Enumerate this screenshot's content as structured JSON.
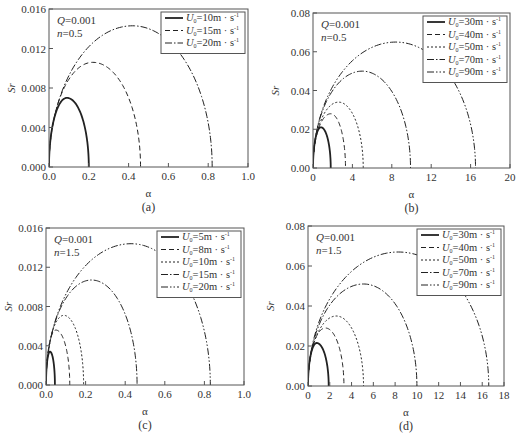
{
  "figure": {
    "panels_layout": "2x2",
    "styles": {
      "axis_color": "#555555",
      "curve_color": "#222222",
      "legend_border": "#555555"
    }
  },
  "chart_data": [
    {
      "id": "a",
      "type": "line",
      "caption": "(a)",
      "xlabel": "α",
      "ylabel": "Sr",
      "annotation": [
        "Q=0.001",
        "n=0.5"
      ],
      "annotation_parts": [
        {
          "var": "Q",
          "val": "=0.001"
        },
        {
          "var": "n",
          "val": "=0.5"
        }
      ],
      "xlim": [
        0,
        1.0
      ],
      "ylim": [
        0,
        0.016
      ],
      "xticks": [
        0.0,
        0.2,
        0.4,
        0.6,
        0.8,
        1.0
      ],
      "xtick_labels": [
        "0.0",
        "0.2",
        "0.4",
        "0.6",
        "0.8",
        "1.0"
      ],
      "yticks": [
        0.0,
        0.004,
        0.008,
        0.012,
        0.016
      ],
      "ytick_labels": [
        "0.000",
        "0.004",
        "0.008",
        "0.012",
        "0.016"
      ],
      "grid": false,
      "legend_position": "upper right",
      "series": [
        {
          "name": "U0=10m·s⁻¹",
          "u0": "10",
          "style": "solid",
          "peak_x": 0.09,
          "peak_y": 0.007,
          "end_x": 0.2
        },
        {
          "name": "U0=15m·s⁻¹",
          "u0": "15",
          "style": "dashed",
          "peak_x": 0.22,
          "peak_y": 0.0106,
          "end_x": 0.46
        },
        {
          "name": "U0=20m·s⁻¹",
          "u0": "20",
          "style": "dashdot",
          "peak_x": 0.42,
          "peak_y": 0.0143,
          "end_x": 0.82
        }
      ],
      "box": {
        "x0": 49,
        "y0": 9,
        "x1": 248,
        "y1": 167
      }
    },
    {
      "id": "b",
      "type": "line",
      "caption": "(b)",
      "xlabel": "α",
      "ylabel": "Sr",
      "annotation": [
        "Q=0.001",
        "n=0.5"
      ],
      "annotation_parts": [
        {
          "var": "Q",
          "val": "=0.001"
        },
        {
          "var": "n",
          "val": "=0.5"
        }
      ],
      "xlim": [
        0,
        20
      ],
      "ylim": [
        0,
        0.08
      ],
      "xticks": [
        0,
        4,
        8,
        12,
        16,
        20
      ],
      "xtick_labels": [
        "0",
        "4",
        "8",
        "12",
        "16",
        "20"
      ],
      "yticks": [
        0.0,
        0.02,
        0.04,
        0.06,
        0.08
      ],
      "ytick_labels": [
        "0.00",
        "0.02",
        "0.04",
        "0.06",
        "0.08"
      ],
      "grid": false,
      "legend_position": "upper right",
      "series": [
        {
          "name": "U0=30m·s⁻¹",
          "u0": "30",
          "style": "solid",
          "peak_x": 0.8,
          "peak_y": 0.021,
          "end_x": 1.8
        },
        {
          "name": "U0=40m·s⁻¹",
          "u0": "40",
          "style": "dashed",
          "peak_x": 1.8,
          "peak_y": 0.028,
          "end_x": 3.3
        },
        {
          "name": "U0=50m·s⁻¹",
          "u0": "50",
          "style": "dotted",
          "peak_x": 2.6,
          "peak_y": 0.034,
          "end_x": 5.1
        },
        {
          "name": "U0=70m·s⁻¹",
          "u0": "70",
          "style": "dashdot",
          "peak_x": 5.0,
          "peak_y": 0.05,
          "end_x": 9.9
        },
        {
          "name": "U0=90m·s⁻¹",
          "u0": "90",
          "style": "dashdotdot",
          "peak_x": 8.4,
          "peak_y": 0.065,
          "end_x": 16.5
        }
      ],
      "box": {
        "x0": 313,
        "y0": 13,
        "x1": 510,
        "y1": 168
      }
    },
    {
      "id": "c",
      "type": "line",
      "caption": "(c)",
      "xlabel": "α",
      "ylabel": "Sr",
      "annotation": [
        "Q=0.001",
        "n=1.5"
      ],
      "annotation_parts": [
        {
          "var": "Q",
          "val": "=0.001"
        },
        {
          "var": "n",
          "val": "=1.5"
        }
      ],
      "xlim": [
        0,
        1.0
      ],
      "ylim": [
        0,
        0.016
      ],
      "xticks": [
        0.0,
        0.2,
        0.4,
        0.6,
        0.8,
        1.0
      ],
      "xtick_labels": [
        "0.0",
        "0.2",
        "0.4",
        "0.6",
        "0.8",
        "1.0"
      ],
      "yticks": [
        0.0,
        0.004,
        0.008,
        0.012,
        0.016
      ],
      "ytick_labels": [
        "0.000",
        "0.004",
        "0.008",
        "0.012",
        "0.016"
      ],
      "grid": false,
      "legend_position": "upper right",
      "series": [
        {
          "name": "U0=5m·s⁻¹",
          "u0": "5",
          "style": "solid",
          "peak_x": 0.02,
          "peak_y": 0.0034,
          "end_x": 0.045
        },
        {
          "name": "U0=8m·s⁻¹",
          "u0": "8",
          "style": "dashed",
          "peak_x": 0.05,
          "peak_y": 0.0056,
          "end_x": 0.12
        },
        {
          "name": "U0=10m·s⁻¹",
          "u0": "10",
          "style": "dotted",
          "peak_x": 0.09,
          "peak_y": 0.0071,
          "end_x": 0.19
        },
        {
          "name": "U0=15m·s⁻¹",
          "u0": "15",
          "style": "dashdot",
          "peak_x": 0.23,
          "peak_y": 0.0107,
          "end_x": 0.46
        },
        {
          "name": "U0=20m·s⁻¹",
          "u0": "20",
          "style": "dashdotdot",
          "peak_x": 0.43,
          "peak_y": 0.0144,
          "end_x": 0.83
        }
      ],
      "box": {
        "x0": 46,
        "y0": 228,
        "x1": 244,
        "y1": 385
      }
    },
    {
      "id": "d",
      "type": "line",
      "caption": "(d)",
      "xlabel": "α",
      "ylabel": "Sr",
      "annotation": [
        "Q=0.001",
        "n=1.5"
      ],
      "annotation_parts": [
        {
          "var": "Q",
          "val": "=0.001"
        },
        {
          "var": "n",
          "val": "=1.5"
        }
      ],
      "xlim": [
        0,
        18
      ],
      "ylim": [
        0,
        0.08
      ],
      "xticks": [
        0,
        2,
        4,
        6,
        8,
        10,
        12,
        14,
        16,
        18
      ],
      "xtick_labels": [
        "0",
        "2",
        "4",
        "6",
        "8",
        "10",
        "12",
        "14",
        "16",
        "18"
      ],
      "yticks": [
        0.0,
        0.02,
        0.04,
        0.06,
        0.08
      ],
      "ytick_labels": [
        "0.00",
        "0.02",
        "0.04",
        "0.06",
        "0.08"
      ],
      "grid": false,
      "legend_position": "upper right",
      "series": [
        {
          "name": "U0=30m·s⁻¹",
          "u0": "30",
          "style": "solid",
          "peak_x": 0.8,
          "peak_y": 0.0215,
          "end_x": 1.9
        },
        {
          "name": "U0=40m·s⁻¹",
          "u0": "40",
          "style": "dashed",
          "peak_x": 1.6,
          "peak_y": 0.029,
          "end_x": 3.3
        },
        {
          "name": "U0=50m·s⁻¹",
          "u0": "50",
          "style": "dotted",
          "peak_x": 2.6,
          "peak_y": 0.035,
          "end_x": 5.1
        },
        {
          "name": "U0=70m·s⁻¹",
          "u0": "70",
          "style": "dashdot",
          "peak_x": 5.1,
          "peak_y": 0.051,
          "end_x": 10.0
        },
        {
          "name": "U0=90m·s⁻¹",
          "u0": "90",
          "style": "dashdotdot",
          "peak_x": 8.3,
          "peak_y": 0.067,
          "end_x": 16.6
        }
      ],
      "box": {
        "x0": 308,
        "y0": 226,
        "x1": 504,
        "y1": 386
      }
    }
  ],
  "legend": {
    "symbol": "U",
    "subscript": "0",
    "unit": "m · s",
    "unit_exp": "-1"
  }
}
